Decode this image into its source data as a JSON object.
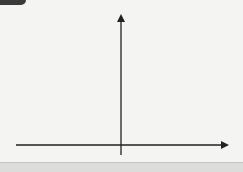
{
  "chart_data": {
    "type": "line",
    "title": "",
    "xlabel": "x",
    "ylabel": "y",
    "xlim": [
      -4,
      4
    ],
    "ylim": [
      0,
      5
    ],
    "x_ticks": [
      "-3",
      "-2",
      "-1",
      "0",
      "1",
      "2",
      "3"
    ],
    "y_ticks": [
      "1",
      "2",
      "3",
      "4"
    ],
    "grid": true,
    "series": [
      {
        "name": "y = 2^x",
        "x": [
          -4,
          -3,
          -2,
          -1,
          0,
          1,
          2,
          2.32
        ],
        "y": [
          0.0625,
          0.125,
          0.25,
          0.5,
          1,
          2,
          4,
          5
        ]
      }
    ],
    "colors": {
      "curve": "#222222",
      "grid": "#d8d8d8",
      "axis": "#222222",
      "background": "#f4f4f2"
    }
  },
  "labels": {
    "x_axis": "x",
    "y_axis": "y",
    "origin": "0",
    "xt": [
      "-3",
      "-2",
      "-1",
      "1",
      "2",
      "3"
    ],
    "yt": [
      "1",
      "2",
      "3",
      "4"
    ]
  }
}
